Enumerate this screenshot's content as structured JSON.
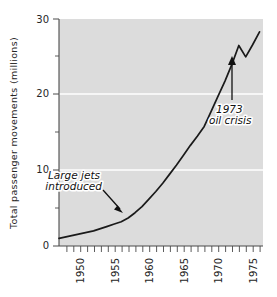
{
  "chart_data": {
    "type": "line",
    "title": "",
    "xlabel": "",
    "ylabel": "Total passenger movements (millions)",
    "xlim": [
      1947,
      1976.5
    ],
    "ylim": [
      0,
      30
    ],
    "grid": true,
    "legend": null,
    "y_ticks_major": [
      0,
      10,
      20,
      30
    ],
    "y_tick_labels": [
      "0",
      "10",
      "20",
      "30"
    ],
    "y_ticks_minor": [
      5,
      15,
      25
    ],
    "x_ticks_major": [
      1950,
      1955,
      1960,
      1965,
      1970,
      1975
    ],
    "x_tick_labels": [
      "1950",
      "1955",
      "1960",
      "1965",
      "1970",
      "1975"
    ],
    "x_ticks_minor_step": 1,
    "x": [
      1947,
      1948,
      1949,
      1950,
      1951,
      1952,
      1953,
      1954,
      1955,
      1956,
      1957,
      1958,
      1959,
      1960,
      1961,
      1962,
      1963,
      1964,
      1965,
      1966,
      1967,
      1968,
      1969,
      1970,
      1971,
      1972,
      1973,
      1974,
      1975,
      1976
    ],
    "values": [
      1.0,
      1.2,
      1.4,
      1.6,
      1.8,
      2.0,
      2.3,
      2.6,
      2.9,
      3.2,
      3.7,
      4.4,
      5.2,
      6.2,
      7.2,
      8.3,
      9.5,
      10.7,
      12.0,
      13.3,
      14.5,
      15.8,
      17.8,
      19.8,
      21.8,
      24.0,
      26.5,
      25.0,
      26.6,
      28.3
    ],
    "series_color": "#1a1a1a",
    "plot_background": "#dcdcdc",
    "gridline_color": "#ffffff",
    "annotations": [
      {
        "id": "large-jets",
        "line1": "Large jets",
        "line2": "introduced",
        "points_to_year": 1958,
        "points_to_value": 4.4
      },
      {
        "id": "oil-crisis",
        "line1": "1973",
        "line2": "oil crisis",
        "points_to_year": 1973,
        "points_to_value": 24.8
      }
    ]
  }
}
